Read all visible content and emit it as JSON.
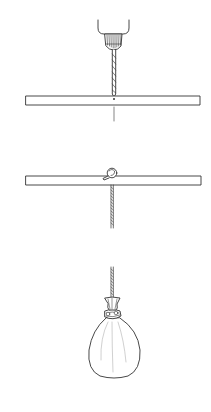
{
  "figure": {
    "steps": [
      {
        "id": "drill-rod",
        "label": ""
      },
      {
        "id": "thread-cord",
        "label": ""
      },
      {
        "id": "hang-bag",
        "label": ""
      }
    ],
    "colors": {
      "line": "#333333",
      "fill": "#ffffff",
      "background": "#ffffff"
    }
  }
}
